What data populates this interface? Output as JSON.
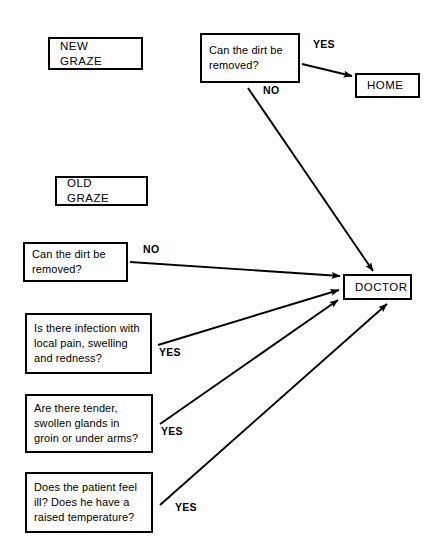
{
  "diagram": {
    "stroke_color": "#000000",
    "background_color": "#ffffff",
    "nodes": [
      {
        "id": "new-graze",
        "label": "NEW GRAZE",
        "kind": "terminal",
        "x": 48,
        "y": 37,
        "w": 95,
        "h": 33
      },
      {
        "id": "new-dirt",
        "label": "Can the dirt be\nremoved?",
        "kind": "decision",
        "x": 200,
        "y": 33,
        "w": 100,
        "h": 50
      },
      {
        "id": "home",
        "label": "HOME",
        "kind": "terminal",
        "x": 355,
        "y": 73,
        "w": 65,
        "h": 25
      },
      {
        "id": "old-graze",
        "label": "OLD GRAZE",
        "kind": "terminal",
        "x": 55,
        "y": 176,
        "w": 93,
        "h": 30
      },
      {
        "id": "old-dirt",
        "label": "Can the dirt be\nremoved?",
        "kind": "decision",
        "x": 23,
        "y": 242,
        "w": 105,
        "h": 40
      },
      {
        "id": "infection",
        "label": "Is there infection with\nlocal pain, swelling\nand redness?",
        "kind": "decision",
        "x": 25,
        "y": 313,
        "w": 127,
        "h": 61
      },
      {
        "id": "glands",
        "label": "Are there tender,\nswollen glands in\ngroin or under arms?",
        "kind": "decision",
        "x": 25,
        "y": 394,
        "w": 128,
        "h": 59
      },
      {
        "id": "unwell",
        "label": "Does the patient feel\nill? Does he have a\nraised temperature?",
        "kind": "decision",
        "x": 25,
        "y": 472,
        "w": 128,
        "h": 61
      },
      {
        "id": "doctor",
        "label": "DOCTOR",
        "kind": "terminal",
        "x": 343,
        "y": 274,
        "w": 69,
        "h": 26
      }
    ],
    "edges": [
      {
        "id": "new-dirt-yes",
        "from": "new-dirt",
        "to": "home",
        "label": "YES",
        "x1": 302,
        "y1": 64,
        "x2": 352,
        "y2": 76
      },
      {
        "id": "new-dirt-no",
        "from": "new-dirt",
        "to": "doctor",
        "label": "NO",
        "x1": 248,
        "y1": 88,
        "x2": 373,
        "y2": 271
      },
      {
        "id": "old-dirt-no",
        "from": "old-dirt",
        "to": "doctor",
        "label": "NO",
        "x1": 130,
        "y1": 262,
        "x2": 340,
        "y2": 276
      },
      {
        "id": "infection-yes",
        "from": "infection",
        "to": "doctor",
        "label": "YES",
        "x1": 158,
        "y1": 345,
        "x2": 339,
        "y2": 290
      },
      {
        "id": "glands-yes",
        "from": "glands",
        "to": "doctor",
        "label": "YES",
        "x1": 160,
        "y1": 424,
        "x2": 338,
        "y2": 300
      },
      {
        "id": "unwell-yes",
        "from": "unwell",
        "to": "doctor",
        "label": "YES",
        "x1": 160,
        "y1": 505,
        "x2": 387,
        "y2": 304
      }
    ],
    "edge_labels": [
      {
        "id": "label-new-yes",
        "text": "YES",
        "x": 313,
        "y": 38
      },
      {
        "id": "label-new-no",
        "text": "NO",
        "x": 263,
        "y": 84
      },
      {
        "id": "label-old-no",
        "text": "NO",
        "x": 143,
        "y": 243
      },
      {
        "id": "label-infection-yes",
        "text": "YES",
        "x": 159,
        "y": 346
      },
      {
        "id": "label-glands-yes",
        "text": "YES",
        "x": 161,
        "y": 425
      },
      {
        "id": "label-unwell-yes",
        "text": "YES",
        "x": 175,
        "y": 501
      }
    ]
  }
}
